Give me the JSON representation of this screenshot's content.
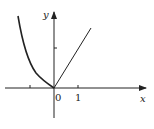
{
  "diagram": {
    "type": "function-graph",
    "axes": {
      "x_label": "x",
      "y_label": "y",
      "origin_label": "0",
      "x_tick_labels": [
        "1"
      ]
    },
    "curves": [
      {
        "name": "left-branch",
        "description": "decreasing convex curve for x<0 approaching origin"
      },
      {
        "name": "right-branch",
        "description": "straight line through origin for x>=0"
      }
    ],
    "colors": {
      "stroke": "#222222",
      "background": "#ffffff"
    }
  }
}
